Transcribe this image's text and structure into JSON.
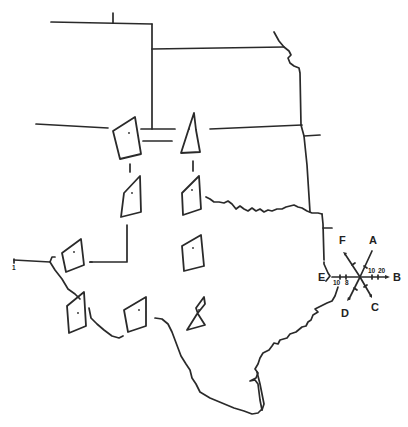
{
  "diagram": {
    "type": "map",
    "ink_color": "#2a2a2a",
    "background": "#ffffff",
    "compass": {
      "labels": {
        "A": "A",
        "B": "B",
        "C": "C",
        "D": "D",
        "E": "E",
        "F": "F"
      },
      "ticks": {
        "b_10": "10",
        "b_20": "20",
        "e_10": "10",
        "e_8": "8"
      }
    },
    "stations": [
      {
        "id": "s1",
        "row": 1,
        "col": 1
      },
      {
        "id": "s2",
        "row": 1,
        "col": 2
      },
      {
        "id": "s3",
        "row": 2,
        "col": 1
      },
      {
        "id": "s4",
        "row": 2,
        "col": 2
      },
      {
        "id": "s5",
        "row": 3,
        "col": 1
      },
      {
        "id": "s6",
        "row": 3,
        "col": 2
      },
      {
        "id": "s7",
        "row": 4,
        "col": 1
      },
      {
        "id": "s8",
        "row": 4,
        "col": 2
      },
      {
        "id": "s9",
        "row": 4,
        "col": 3
      }
    ],
    "margin_mark": "1"
  }
}
